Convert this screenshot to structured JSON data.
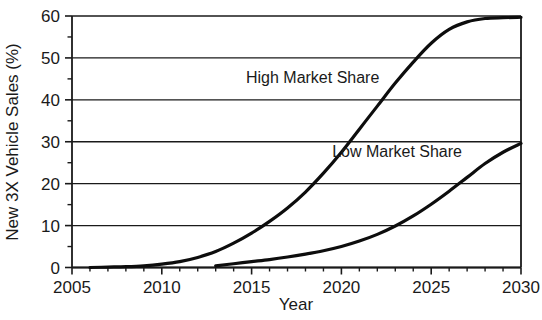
{
  "chart_data": {
    "type": "line",
    "title": "",
    "xlabel": "Year",
    "ylabel": "New 3X Vehicle Sales (%)",
    "xlim": [
      2005,
      2030
    ],
    "ylim": [
      0,
      60
    ],
    "grid": true,
    "grid_axis": "y",
    "legend": "inline-annotations",
    "x_ticks": [
      2005,
      2010,
      2015,
      2020,
      2025,
      2030
    ],
    "x_tick_labels": [
      "2005",
      "2010",
      "2015",
      "2020",
      "2025",
      "2030"
    ],
    "x_minor_ticks": [
      2006,
      2007,
      2008,
      2009,
      2011,
      2012,
      2013,
      2014,
      2016,
      2017,
      2018,
      2019,
      2021,
      2022,
      2023,
      2024,
      2026,
      2027,
      2028,
      2029
    ],
    "y_ticks": [
      0,
      10,
      20,
      30,
      40,
      50,
      60
    ],
    "y_tick_labels": [
      "0",
      "10",
      "20",
      "30",
      "40",
      "50",
      "60"
    ],
    "y_minor_ticks": [
      5,
      15,
      25,
      35,
      45,
      55
    ],
    "series": [
      {
        "name": "High Market Share",
        "color": "#0d0d0d",
        "x": [
          2006,
          2007,
          2008,
          2009,
          2010,
          2011,
          2012,
          2013,
          2014,
          2015,
          2016,
          2017,
          2018,
          2019,
          2020,
          2021,
          2022,
          2023,
          2024,
          2025,
          2026,
          2027,
          2028,
          2029,
          2030
        ],
        "values": [
          0.0,
          0.1,
          0.2,
          0.4,
          0.8,
          1.4,
          2.4,
          3.8,
          5.8,
          8.2,
          11.0,
          14.2,
          18.0,
          22.5,
          27.5,
          33.0,
          38.5,
          44.0,
          49.0,
          53.5,
          56.8,
          58.6,
          59.4,
          59.6,
          59.7
        ]
      },
      {
        "name": "Low Market Share",
        "color": "#0d0d0d",
        "x": [
          2013,
          2014,
          2015,
          2016,
          2017,
          2018,
          2019,
          2020,
          2021,
          2022,
          2023,
          2024,
          2025,
          2026,
          2027,
          2028,
          2029,
          2030
        ],
        "values": [
          0.4,
          0.9,
          1.4,
          1.9,
          2.5,
          3.2,
          4.0,
          5.0,
          6.3,
          7.9,
          9.9,
          12.3,
          15.1,
          18.2,
          21.5,
          24.8,
          27.5,
          29.6
        ]
      }
    ],
    "annotations": [
      {
        "text": "High Market Share",
        "x": 2018.4,
        "y": 44.0,
        "name": "high-market-share-annotation"
      },
      {
        "text": "Low Market Share",
        "x": 2023.1,
        "y": 26.4,
        "name": "low-market-share-annotation"
      }
    ]
  }
}
